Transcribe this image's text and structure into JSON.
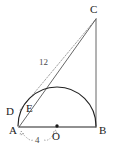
{
  "figure": {
    "canvas": {
      "width": 113,
      "height": 149
    },
    "colors": {
      "background": "#ffffff",
      "solid_line": "#222222",
      "thin_line": "#555555",
      "dashed_line": "#9a9a9a",
      "label_text": "#1a1a1a",
      "dimension_text": "#4a4a4a"
    },
    "points": [
      {
        "name": "A",
        "label": "A",
        "x": 19,
        "y": 127,
        "label_x": 9,
        "label_y": 134,
        "marker": false
      },
      {
        "name": "B",
        "label": "B",
        "x": 96,
        "y": 127,
        "label_x": 99,
        "label_y": 134,
        "marker": false
      },
      {
        "name": "C",
        "label": "C",
        "x": 96,
        "y": 19,
        "label_x": 92,
        "label_y": 13,
        "marker": false
      },
      {
        "name": "D",
        "label": "D",
        "x": 20,
        "y": 110,
        "label_x": 8,
        "label_y": 114,
        "marker": false
      },
      {
        "name": "E",
        "label": "E",
        "x": 29,
        "y": 108,
        "label_x": 27,
        "label_y": 112,
        "marker": false
      },
      {
        "name": "O",
        "label": "O",
        "x": 57,
        "y": 126,
        "label_x": 53,
        "label_y": 138,
        "marker": true
      }
    ],
    "segments": [
      {
        "name": "base-AB",
        "from": "A",
        "to": "B",
        "style": "solid"
      },
      {
        "name": "vertical-BC",
        "from": "B",
        "to": "C",
        "style": "solid"
      },
      {
        "name": "hypotenuse-AC",
        "from": "A",
        "to": "C",
        "style": "thin"
      },
      {
        "name": "tangent-DC",
        "from": "D",
        "to": "C",
        "style": "dashed"
      }
    ],
    "arcs": [
      {
        "name": "semicircle-AOB",
        "center_x": 57,
        "center_y": 126,
        "radius": 39,
        "style": "solid",
        "description": "semicircle on diameter AB centered at O"
      }
    ],
    "dimensions": [
      {
        "name": "dimension-12",
        "label": "12",
        "value": 12,
        "label_x": 42,
        "label_y": 62,
        "measures": "D to C"
      },
      {
        "name": "dimension-4",
        "label": "4",
        "value": 4,
        "label_x": 36,
        "label_y": 141,
        "measures": "A to O (radius)"
      }
    ]
  }
}
